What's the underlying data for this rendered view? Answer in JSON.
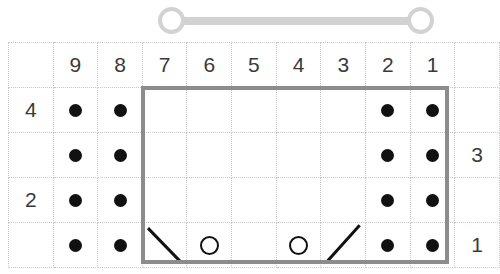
{
  "slider": {
    "name": "range-slider",
    "track_color": "#d2d2d2",
    "knob_color": "#d2d2d2",
    "left_knob_label": "",
    "right_knob_label": ""
  },
  "grid": {
    "columns": 11,
    "rows": 5,
    "cell_size_px": 44,
    "grid_line_color": "#c9c9c9",
    "dot_color": "#111111",
    "column_headers": [
      "",
      "9",
      "8",
      "7",
      "6",
      "5",
      "4",
      "3",
      "2",
      "1",
      ""
    ],
    "row_labels_left": [
      "",
      "4",
      "",
      "2",
      ""
    ],
    "row_labels_right": [
      "",
      "",
      "3",
      "",
      "1"
    ],
    "rows_data": [
      {
        "label_left": "",
        "label_right": "",
        "cells": [
          "",
          "9",
          "8",
          "7",
          "6",
          "5",
          "4",
          "3",
          "2",
          "1",
          ""
        ],
        "kind": "header"
      },
      {
        "label_left": "4",
        "label_right": "",
        "marks": [
          "",
          "dot",
          "dot",
          "",
          "",
          "",
          "",
          "",
          "dot",
          "dot",
          ""
        ]
      },
      {
        "label_left": "",
        "label_right": "3",
        "marks": [
          "",
          "dot",
          "dot",
          "",
          "",
          "",
          "",
          "",
          "dot",
          "dot",
          ""
        ]
      },
      {
        "label_left": "2",
        "label_right": "",
        "marks": [
          "",
          "dot",
          "dot",
          "",
          "",
          "",
          "",
          "",
          "dot",
          "dot",
          ""
        ]
      },
      {
        "label_left": "",
        "label_right": "1",
        "marks": [
          "",
          "dot",
          "dot",
          "backslash",
          "ring",
          "",
          "ring",
          "slash",
          "dot",
          "dot",
          ""
        ]
      }
    ]
  },
  "selection_box": {
    "name": "selection-box",
    "border_color": "#8c8c8c",
    "border_width_px": 4,
    "spans_columns": [
      "7",
      "6",
      "5",
      "4",
      "3",
      "2",
      "1"
    ],
    "spans_rows": 4
  },
  "chart_data": {
    "type": "table",
    "title": "",
    "columns": [
      "",
      "9",
      "8",
      "7",
      "6",
      "5",
      "4",
      "3",
      "2",
      "1",
      ""
    ],
    "row_left_labels": [
      "",
      "4",
      "",
      "2",
      ""
    ],
    "row_right_labels": [
      "",
      "",
      "3",
      "",
      "1"
    ],
    "cell_marks": [
      [
        "",
        "",
        "",
        "",
        "",
        "",
        "",
        "",
        "",
        "",
        ""
      ],
      [
        "4",
        "dot",
        "dot",
        "",
        "",
        "",
        "",
        "",
        "dot",
        "dot",
        ""
      ],
      [
        "",
        "dot",
        "dot",
        "",
        "",
        "",
        "",
        "",
        "dot",
        "dot",
        "3"
      ],
      [
        "2",
        "dot",
        "dot",
        "",
        "",
        "",
        "",
        "",
        "dot",
        "dot",
        ""
      ],
      [
        "",
        "dot",
        "dot",
        "backslash",
        "ring",
        "",
        "ring",
        "slash",
        "dot",
        "dot",
        "1"
      ]
    ],
    "legend": [],
    "grid": true
  }
}
